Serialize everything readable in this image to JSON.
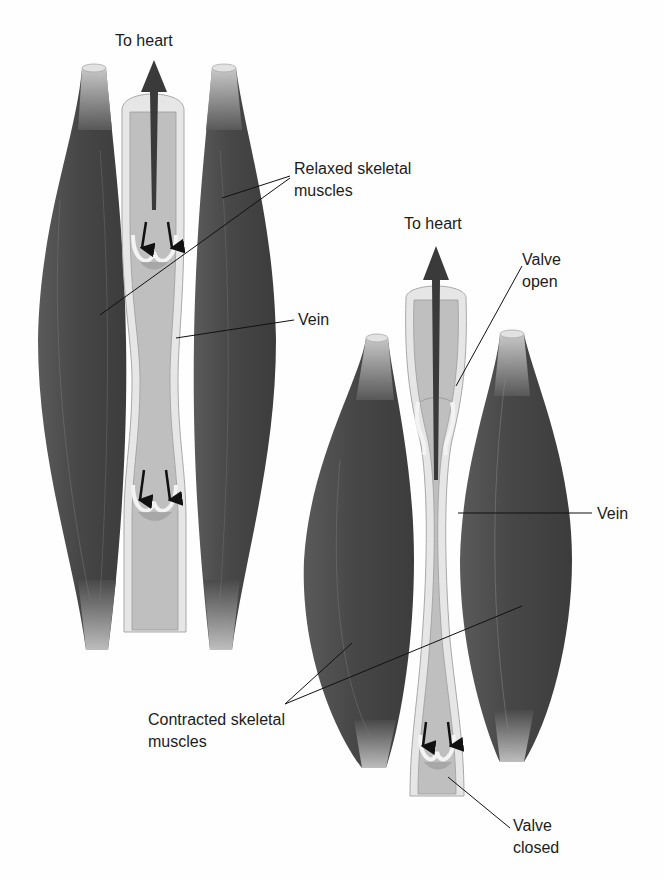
{
  "figure": {
    "panel_relaxed": {
      "flow_label": "To heart",
      "muscle_label_line1": "Relaxed skeletal",
      "muscle_label_line2": "muscles",
      "vein_label": "Vein"
    },
    "panel_contracted": {
      "flow_label": "To heart",
      "valve_open_line1": "Valve",
      "valve_open_line2": "open",
      "vein_label": "Vein",
      "muscle_label_line1": "Contracted skeletal",
      "muscle_label_line2": "muscles",
      "valve_closed_line1": "Valve",
      "valve_closed_line2": "closed"
    },
    "colors": {
      "muscle_dark": "#4a4a4a",
      "muscle_mid": "#6a6a6a",
      "tendon": "#c9c9c9",
      "vein_wall": "#e4e4e4",
      "vein_lumen": "#bdbdbd",
      "arrow": "#3a3a3a",
      "leader_line": "#111111"
    }
  }
}
